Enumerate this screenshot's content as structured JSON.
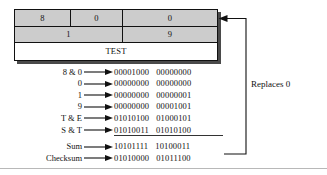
{
  "figure": {
    "packet_table": {
      "row1": [
        {
          "value": "8",
          "name": "packet-field-8"
        },
        {
          "value": "0",
          "name": "packet-field-0-a"
        },
        {
          "value": "0",
          "name": "packet-field-0-checksum"
        }
      ],
      "row2": [
        {
          "value": "1",
          "name": "packet-field-1"
        },
        {
          "value": "9",
          "name": "packet-field-9"
        }
      ],
      "row3": [
        {
          "value": "TEST",
          "name": "packet-field-test"
        }
      ]
    },
    "annotation": {
      "replaces_label": "Replaces 0"
    },
    "calculation": {
      "rows": [
        {
          "label": "8 & 0",
          "high": "00001000",
          "low": "00000000"
        },
        {
          "label": "0",
          "high": "00000000",
          "low": "00000000"
        },
        {
          "label": "1",
          "high": "00000000",
          "low": "00000001"
        },
        {
          "label": "9",
          "high": "00000000",
          "low": "00001001"
        },
        {
          "label": "T & E",
          "high": "01010100",
          "low": "01000101"
        },
        {
          "label": "S & T",
          "high": "01010011",
          "low": "01010100"
        }
      ],
      "results": [
        {
          "label": "Sum",
          "high": "10101111",
          "low": "10100011"
        },
        {
          "label": "Checksum",
          "high": "01010000",
          "low": "01011100"
        }
      ]
    },
    "colors": {
      "cell_fill": "#cccccc",
      "border": "#111111",
      "shadow": "#4a4a4a",
      "text": "#111111",
      "rule": "#333333"
    }
  }
}
